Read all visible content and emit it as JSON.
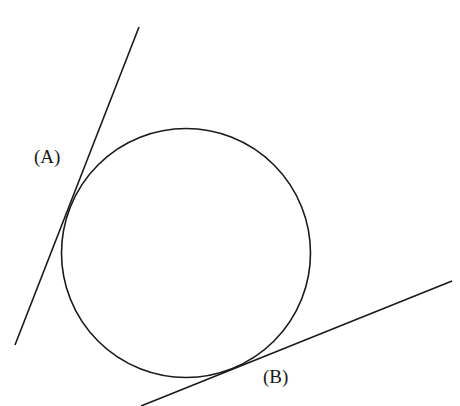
{
  "diagram": {
    "labels": {
      "a": "(A)",
      "b": "(B)"
    },
    "stroke_color": "#1a1a1a",
    "circle": {
      "cx": 186,
      "cy": 253,
      "r": 125
    },
    "tangent_a": {
      "x1": 139,
      "y1": 27,
      "x2": 15,
      "y2": 345
    },
    "tangent_b": {
      "x1": 452,
      "y1": 281,
      "x2": 141,
      "y2": 406
    }
  }
}
